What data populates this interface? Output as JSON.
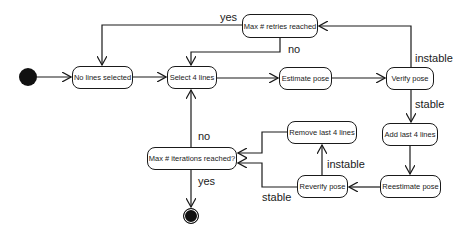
{
  "diagram": {
    "type": "activity",
    "colors": {
      "stroke": "#1a1a1a",
      "terminal": "#111111",
      "background": "#ffffff"
    },
    "nodes": {
      "no_lines_selected": "No lines selected",
      "select_4_lines": "Select 4 lines",
      "estimate_pose": "Estimate pose",
      "verify_pose": "Verify pose",
      "max_retries": "Max # retries reached",
      "add_last_4_lines": "Add last 4 lines",
      "reestimate_pose": "Reestimate pose",
      "reverify_pose": "Reverify pose",
      "remove_last_4_lines": "Remove last 4 lines",
      "max_iterations": "Max # iterations reached?"
    },
    "edge_labels": {
      "retries_yes": "yes",
      "retries_no": "no",
      "verify_instable": "instable",
      "verify_stable": "stable",
      "reverify_instable": "instable",
      "reverify_stable": "stable",
      "iterations_no": "no",
      "iterations_yes": "yes"
    },
    "edges": [
      {
        "from": "start",
        "to": "No lines selected"
      },
      {
        "from": "No lines selected",
        "to": "Select 4 lines"
      },
      {
        "from": "Select 4 lines",
        "to": "Estimate pose"
      },
      {
        "from": "Estimate pose",
        "to": "Verify pose"
      },
      {
        "from": "Verify pose",
        "to": "Max # retries reached",
        "label": "instable"
      },
      {
        "from": "Max # retries reached",
        "to": "No lines selected",
        "label": "yes"
      },
      {
        "from": "Max # retries reached",
        "to": "Select 4 lines",
        "label": "no"
      },
      {
        "from": "Verify pose",
        "to": "Add last 4 lines",
        "label": "stable"
      },
      {
        "from": "Add last 4 lines",
        "to": "Reestimate pose"
      },
      {
        "from": "Reestimate pose",
        "to": "Reverify pose"
      },
      {
        "from": "Reverify pose",
        "to": "Remove last 4 lines",
        "label": "instable"
      },
      {
        "from": "Reverify pose",
        "to": "Max # iterations reached?",
        "label": "stable"
      },
      {
        "from": "Remove last 4 lines",
        "to": "Max # iterations reached?"
      },
      {
        "from": "Max # iterations reached?",
        "to": "Select 4 lines",
        "label": "no"
      },
      {
        "from": "Max # iterations reached?",
        "to": "end",
        "label": "yes"
      }
    ]
  }
}
